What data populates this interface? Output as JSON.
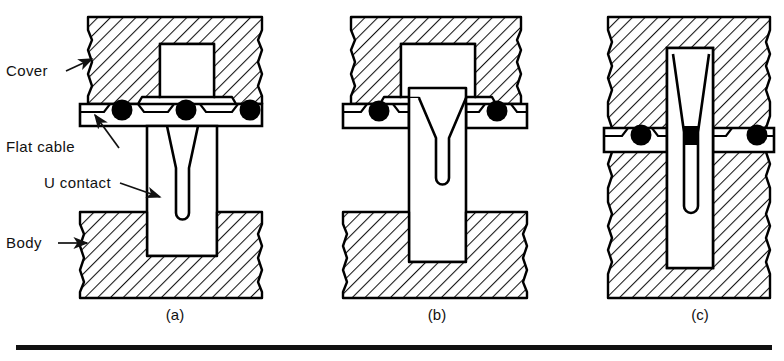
{
  "figure": {
    "background_color": "#ffffff",
    "ink_color": "#000000",
    "hatch_color": "#1a1a1a",
    "conductor_color": "#000000"
  },
  "callouts": [
    {
      "id": "cover",
      "label": "Cover",
      "x": 6,
      "y": 76,
      "arrow_from": [
        66,
        70
      ],
      "arrow_to": [
        92,
        58
      ]
    },
    {
      "id": "flat-cable",
      "label": "Flat cable",
      "x": 6,
      "y": 152,
      "arrow_from": [
        117,
        146
      ],
      "arrow_to": [
        93,
        114
      ]
    },
    {
      "id": "u-contact",
      "label": "U contact",
      "x": 44,
      "y": 188,
      "arrow_from": [
        118,
        184
      ],
      "arrow_to": [
        158,
        196
      ]
    },
    {
      "id": "body",
      "label": "Body",
      "x": 6,
      "y": 248,
      "arrow_from": [
        60,
        243
      ],
      "arrow_to": [
        87,
        243
      ]
    }
  ],
  "panels": [
    {
      "id": "a",
      "label": "(a)",
      "label_x": 175,
      "label_y": 320,
      "caption_state": "cover raised, U contact above cable"
    },
    {
      "id": "b",
      "label": "(b)",
      "label_x": 437,
      "label_y": 320,
      "caption_state": "contact piercing cable insulation"
    },
    {
      "id": "c",
      "label": "(c)",
      "label_x": 700,
      "label_y": 320,
      "caption_state": "fully mated, conductor seated in slot"
    }
  ],
  "conductors": {
    "count_per_panel": 3,
    "note": "round conductors shown solid black in cable cross section"
  },
  "rule": {
    "y": 347,
    "x1": 16,
    "x2": 772,
    "thickness": 5
  }
}
